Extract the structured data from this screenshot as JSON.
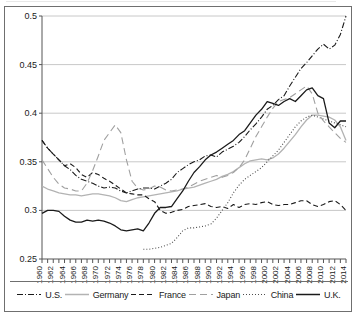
{
  "chart_data": {
    "type": "line",
    "title": "",
    "xlabel": "",
    "ylabel": "",
    "xlim": [
      1960,
      2014
    ],
    "ylim": [
      0.25,
      0.5
    ],
    "yticks": [
      0.25,
      0.3,
      0.35,
      0.4,
      0.45,
      0.5
    ],
    "ytick_labels": [
      "0.25",
      "0.3",
      "0.35",
      "0.4",
      "0.45",
      "0.5"
    ],
    "xticks": [
      1960,
      1962,
      1964,
      1966,
      1968,
      1970,
      1972,
      1974,
      1976,
      1978,
      1980,
      1982,
      1984,
      1986,
      1988,
      1990,
      1992,
      1994,
      1996,
      1998,
      2000,
      2002,
      2004,
      2006,
      2008,
      2010,
      2012,
      2014
    ],
    "xtick_labels": [
      "1960",
      "1962",
      "1964",
      "1966",
      "1968",
      "1970",
      "1972",
      "1974",
      "1976",
      "1978",
      "1980",
      "1982",
      "1984",
      "1986",
      "1988",
      "1990",
      "1992",
      "1994",
      "1996",
      "1998",
      "2000",
      "2002",
      "2004",
      "2006",
      "2008",
      "2010",
      "2012",
      "2014"
    ],
    "grid": "horizontal",
    "legend_position": "bottom",
    "series": [
      {
        "name": "U.S.",
        "style": "dash-dot",
        "color": "#1a1a1a",
        "x": [
          1960,
          1961,
          1962,
          1963,
          1964,
          1965,
          1966,
          1967,
          1968,
          1969,
          1970,
          1971,
          1972,
          1973,
          1974,
          1975,
          1976,
          1977,
          1978,
          1979,
          1980,
          1981,
          1982,
          1983,
          1984,
          1985,
          1986,
          1987,
          1988,
          1989,
          1990,
          1991,
          1992,
          1993,
          1994,
          1995,
          1996,
          1997,
          1998,
          1999,
          2000,
          2001,
          2002,
          2003,
          2004,
          2005,
          2006,
          2007,
          2008,
          2009,
          2010,
          2011,
          2012,
          2013,
          2014
        ],
        "values": [
          0.372,
          0.364,
          0.358,
          0.352,
          0.346,
          0.342,
          0.336,
          0.332,
          0.33,
          0.328,
          0.325,
          0.323,
          0.324,
          0.323,
          0.32,
          0.318,
          0.32,
          0.322,
          0.323,
          0.323,
          0.322,
          0.325,
          0.328,
          0.332,
          0.339,
          0.343,
          0.347,
          0.35,
          0.352,
          0.356,
          0.357,
          0.355,
          0.36,
          0.363,
          0.366,
          0.37,
          0.376,
          0.383,
          0.389,
          0.396,
          0.404,
          0.408,
          0.414,
          0.418,
          0.428,
          0.437,
          0.446,
          0.452,
          0.459,
          0.466,
          0.471,
          0.466,
          0.47,
          0.481,
          0.5
        ]
      },
      {
        "name": "Germany",
        "style": "solid",
        "color": "#b3b3b3",
        "x": [
          1960,
          1961,
          1962,
          1963,
          1964,
          1965,
          1966,
          1967,
          1968,
          1969,
          1970,
          1971,
          1972,
          1973,
          1974,
          1975,
          1976,
          1977,
          1978,
          1979,
          1980,
          1981,
          1982,
          1983,
          1984,
          1985,
          1986,
          1987,
          1988,
          1989,
          1990,
          1991,
          1992,
          1993,
          1994,
          1995,
          1996,
          1997,
          1998,
          1999,
          2000,
          2001,
          2002,
          2003,
          2004,
          2005,
          2006,
          2007,
          2008,
          2009,
          2010,
          2011,
          2012,
          2013,
          2014
        ],
        "values": [
          0.325,
          0.322,
          0.32,
          0.318,
          0.317,
          0.316,
          0.316,
          0.315,
          0.316,
          0.317,
          0.317,
          0.316,
          0.315,
          0.313,
          0.31,
          0.309,
          0.311,
          0.313,
          0.314,
          0.315,
          0.316,
          0.317,
          0.318,
          0.319,
          0.32,
          0.322,
          0.323,
          0.324,
          0.326,
          0.328,
          0.33,
          0.332,
          0.335,
          0.337,
          0.34,
          0.344,
          0.348,
          0.351,
          0.352,
          0.353,
          0.352,
          0.354,
          0.358,
          0.364,
          0.371,
          0.378,
          0.386,
          0.393,
          0.398,
          0.398,
          0.397,
          0.396,
          0.393,
          0.386,
          0.372
        ]
      },
      {
        "name": "France",
        "style": "dashed",
        "color": "#1a1a1a",
        "x": [
          1960,
          1961,
          1962,
          1963,
          1964,
          1965,
          1966,
          1967,
          1968,
          1969,
          1970,
          1971,
          1972,
          1973,
          1974,
          1975,
          1976,
          1977,
          1978,
          1979,
          1980,
          1981,
          1982,
          1983,
          1984,
          1985,
          1986,
          1987,
          1988,
          1989,
          1990,
          1991,
          1992,
          1993,
          1994,
          1995,
          1996,
          1997,
          1998,
          1999,
          2000,
          2001,
          2002,
          2003,
          2004,
          2005,
          2006,
          2007,
          2008,
          2009,
          2010,
          2011,
          2012,
          2013,
          2014
        ],
        "values": [
          0.372,
          0.364,
          0.358,
          0.352,
          0.346,
          0.348,
          0.344,
          0.337,
          0.334,
          0.339,
          0.337,
          0.333,
          0.33,
          0.326,
          0.322,
          0.318,
          0.317,
          0.316,
          0.316,
          0.312,
          0.309,
          0.3,
          0.297,
          0.298,
          0.3,
          0.301,
          0.304,
          0.305,
          0.306,
          0.307,
          0.304,
          0.303,
          0.304,
          0.302,
          0.306,
          0.303,
          0.306,
          0.307,
          0.306,
          0.308,
          0.309,
          0.306,
          0.305,
          0.306,
          0.306,
          0.308,
          0.31,
          0.31,
          0.306,
          0.304,
          0.306,
          0.309,
          0.31,
          0.306,
          0.3
        ]
      },
      {
        "name": "Japan",
        "style": "long-dash",
        "color": "#a0a0a0",
        "x": [
          1960,
          1961,
          1962,
          1963,
          1964,
          1965,
          1966,
          1967,
          1968,
          1969,
          1970,
          1971,
          1972,
          1973,
          1974,
          1975,
          1976,
          1977,
          1978,
          1979,
          1980,
          1981,
          1982,
          1983,
          1984,
          1985,
          1986,
          1987,
          1988,
          1989,
          1990,
          1991,
          1992,
          1993,
          1994,
          1995,
          1996,
          1997,
          1998,
          1999,
          2000,
          2001,
          2002,
          2003,
          2004,
          2005,
          2006,
          2007,
          2008,
          2009,
          2010,
          2011,
          2012,
          2013,
          2014
        ],
        "values": [
          0.352,
          0.343,
          0.334,
          0.327,
          0.323,
          0.322,
          0.32,
          0.32,
          0.328,
          0.341,
          0.356,
          0.372,
          0.38,
          0.388,
          0.38,
          0.352,
          0.33,
          0.323,
          0.321,
          0.322,
          0.325,
          0.324,
          0.321,
          0.32,
          0.321,
          0.322,
          0.324,
          0.327,
          0.33,
          0.332,
          0.334,
          0.336,
          0.334,
          0.336,
          0.339,
          0.344,
          0.352,
          0.364,
          0.376,
          0.386,
          0.396,
          0.405,
          0.412,
          0.414,
          0.416,
          0.42,
          0.424,
          0.428,
          0.42,
          0.4,
          0.392,
          0.386,
          0.38,
          0.374,
          0.37
        ]
      },
      {
        "name": "China",
        "style": "dotted",
        "color": "#4d4d4d",
        "x": [
          1978,
          1979,
          1980,
          1981,
          1982,
          1983,
          1984,
          1985,
          1986,
          1987,
          1988,
          1989,
          1990,
          1991,
          1992,
          1993,
          1994,
          1995,
          1996,
          1997,
          1998,
          1999,
          2000,
          2001,
          2002,
          2003,
          2004,
          2005,
          2006,
          2007,
          2008,
          2009,
          2010,
          2011,
          2012,
          2013,
          2014
        ],
        "values": [
          0.26,
          0.26,
          0.261,
          0.262,
          0.264,
          0.266,
          0.272,
          0.279,
          0.282,
          0.282,
          0.283,
          0.284,
          0.286,
          0.292,
          0.3,
          0.308,
          0.318,
          0.326,
          0.332,
          0.336,
          0.34,
          0.344,
          0.35,
          0.356,
          0.362,
          0.37,
          0.378,
          0.386,
          0.392,
          0.396,
          0.398,
          0.396,
          0.394,
          0.392,
          0.39,
          0.388,
          0.386
        ]
      },
      {
        "name": "U.K.",
        "style": "solid",
        "color": "#1a1a1a",
        "x": [
          1960,
          1961,
          1962,
          1963,
          1964,
          1965,
          1966,
          1967,
          1968,
          1969,
          1970,
          1971,
          1972,
          1973,
          1974,
          1975,
          1976,
          1977,
          1978,
          1979,
          1980,
          1981,
          1982,
          1983,
          1984,
          1985,
          1986,
          1987,
          1988,
          1989,
          1990,
          1991,
          1992,
          1993,
          1994,
          1995,
          1996,
          1997,
          1998,
          1999,
          2000,
          2001,
          2002,
          2003,
          2004,
          2005,
          2006,
          2007,
          2008,
          2009,
          2010,
          2011,
          2012,
          2013,
          2014
        ],
        "values": [
          0.297,
          0.3,
          0.3,
          0.299,
          0.294,
          0.29,
          0.288,
          0.288,
          0.29,
          0.289,
          0.29,
          0.289,
          0.287,
          0.284,
          0.28,
          0.279,
          0.28,
          0.281,
          0.279,
          0.287,
          0.297,
          0.303,
          0.303,
          0.304,
          0.312,
          0.32,
          0.33,
          0.339,
          0.345,
          0.352,
          0.357,
          0.36,
          0.364,
          0.368,
          0.372,
          0.378,
          0.382,
          0.39,
          0.398,
          0.404,
          0.412,
          0.41,
          0.408,
          0.412,
          0.415,
          0.412,
          0.418,
          0.424,
          0.426,
          0.418,
          0.415,
          0.39,
          0.385,
          0.392,
          0.392
        ]
      }
    ]
  },
  "legend": {
    "items": [
      {
        "label": "U.S.",
        "style": "dash-dot",
        "color": "#1a1a1a"
      },
      {
        "label": "Germany",
        "style": "solid",
        "color": "#b3b3b3"
      },
      {
        "label": "France",
        "style": "dashed",
        "color": "#1a1a1a"
      },
      {
        "label": "Japan",
        "style": "long-dash",
        "color": "#a0a0a0"
      },
      {
        "label": "China",
        "style": "dotted",
        "color": "#4d4d4d"
      },
      {
        "label": "U.K.",
        "style": "solid",
        "color": "#1a1a1a"
      }
    ]
  },
  "colors": {
    "frame": "#6f6f6f",
    "grid": "#c8c8c8",
    "axis": "#555555",
    "text": "#1a1a1a",
    "background": "#ffffff"
  }
}
